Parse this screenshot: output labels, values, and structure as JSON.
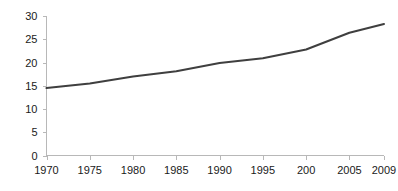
{
  "chart_data": {
    "type": "line",
    "title": "",
    "subtitle": "",
    "xlabel": "",
    "ylabel": "",
    "grid": false,
    "legend": false,
    "legend_position": "none",
    "line_color": "#3f3f3f",
    "axis_color": "#b8b8b8",
    "background_color": "#ffffff",
    "ylim": [
      0,
      30
    ],
    "y_ticks": [
      "0",
      "5",
      "10",
      "15",
      "20",
      "25",
      "30"
    ],
    "y_tick_values": [
      0,
      5,
      10,
      15,
      20,
      25,
      30
    ],
    "x_ticks": [
      "1970",
      "1975",
      "1980",
      "1985",
      "1990",
      "1995",
      "200",
      "2005",
      "2009"
    ],
    "x_tick_values": [
      1970,
      1975,
      1980,
      1985,
      1990,
      1995,
      2000,
      2005,
      2009
    ],
    "categories": [
      1970,
      1975,
      1980,
      1985,
      1990,
      1995,
      2000,
      2005,
      2009
    ],
    "values": [
      14.5,
      15.5,
      17.0,
      18.1,
      19.9,
      20.9,
      22.8,
      26.4,
      28.3
    ],
    "series": [
      {
        "name": "series-1",
        "values": [
          14.5,
          15.5,
          17.0,
          18.1,
          19.9,
          20.9,
          22.8,
          26.4,
          28.3
        ]
      }
    ]
  }
}
